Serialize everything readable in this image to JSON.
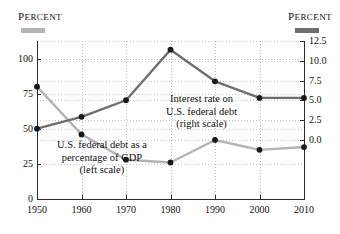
{
  "headers": {
    "left_unit_first": "P",
    "left_unit_rest": "ERCENT",
    "right_unit_first": "P",
    "right_unit_rest": "ERCENT"
  },
  "colors": {
    "debt_line": "#b4b4b4",
    "interest_line": "#6e6e6e",
    "marker": "#1a1a1a",
    "axis": "#2b2b2b",
    "grid": "#c6c6c6"
  },
  "annotations": {
    "interest": {
      "line1": "Interest rate on",
      "line2": "U.S. federal debt",
      "line3": "(right scale)"
    },
    "debt": {
      "line1": "U.S. federal debt as a",
      "line2": "percentage of GDP",
      "line3": "(left scale)"
    }
  },
  "axes": {
    "x_ticks": [
      "1950",
      "1960",
      "1970",
      "1980",
      "1990",
      "2000",
      "2010"
    ],
    "y_left_ticks": [
      "100",
      "75",
      "50",
      "25",
      "0"
    ],
    "y_right_ticks": [
      "12.5",
      "10.0",
      "7.5",
      "5.0",
      "2.5",
      "0.0"
    ]
  },
  "chart_data": {
    "type": "line",
    "title": "",
    "xlabel": "",
    "x": [
      1950,
      1960,
      1970,
      1980,
      1990,
      2000,
      2010
    ],
    "grid": true,
    "legend_position": "inline-annotations",
    "series": [
      {
        "name": "U.S. federal debt as a percentage of GDP",
        "axis": "left",
        "ylabel": "Percent",
        "ylim": [
          0,
          112.5
        ],
        "yticks": [
          0,
          25,
          50,
          75,
          100
        ],
        "color": "#b4b4b4",
        "values": [
          80,
          46,
          28,
          26,
          42,
          35,
          37
        ]
      },
      {
        "name": "Interest rate on U.S. federal debt",
        "axis": "right",
        "ylabel": "Percent",
        "ylim": [
          -7.5,
          12.5
        ],
        "yticks": [
          0.0,
          2.5,
          5.0,
          7.5,
          10.0,
          12.5
        ],
        "color": "#6e6e6e",
        "values": [
          1.4,
          2.9,
          5.0,
          11.4,
          7.4,
          5.3,
          5.3
        ]
      }
    ]
  }
}
